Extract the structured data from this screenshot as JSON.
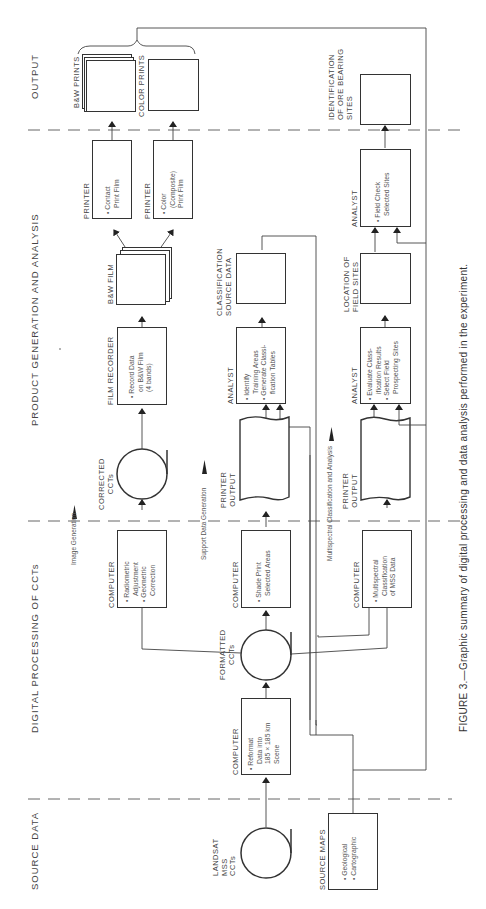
{
  "figure": {
    "caption": "FIGURE 3.—Graphic summary of digital processing and data analysis performed in the experiment."
  },
  "sections": {
    "output": "OUTPUT",
    "product": "PRODUCT GENERATION AND ANALYSIS",
    "digital": "DIGITAL PROCESSING OF CCTs",
    "source": "SOURCE DATA"
  },
  "flows": {
    "image_generation": "Image Generation",
    "support_data_generation": "Support Data Generation",
    "multispectral": "Multispectral Classification and Analysis"
  },
  "nodes": {
    "landsat": {
      "label": "LANDSAT",
      "line2": "MSS",
      "line3": "CCTs"
    },
    "source_maps": {
      "label": "SOURCE MAPS",
      "items": [
        "• Geological",
        "• Cartographic"
      ]
    },
    "reformat": {
      "label": "COMPUTER",
      "items": [
        "• Reformat",
        "Data into",
        "185 × 185 km",
        "Scene"
      ]
    },
    "formatted_ccts": {
      "label": "FORMATTED",
      "line2": "CCTs"
    },
    "radiometric": {
      "label": "COMPUTER",
      "items": [
        "• Radiometric",
        "Adjustment",
        "• Geometric",
        "Correction"
      ]
    },
    "shade_print": {
      "label": "COMPUTER",
      "items": [
        "• Shade Print",
        "Selected Areas"
      ]
    },
    "multispectral_class": {
      "label": "COMPUTER",
      "items": [
        "• Multispectral",
        "Classification",
        "of MSS Data"
      ]
    },
    "corrected_ccts": {
      "label": "CORRECTED",
      "line2": "CCTs"
    },
    "printer_output_1": {
      "label": "PRINTER",
      "line2": "OUTPUT"
    },
    "printer_output_2": {
      "label": "PRINTER",
      "line2": "OUTPUT"
    },
    "film_recorder": {
      "label": "FILM RECORDER",
      "items": [
        "• Record Data",
        "on B&W Film",
        "(4 bands)"
      ]
    },
    "analyst_1": {
      "label": "ANALYST",
      "items": [
        "• Identify",
        "Training Areas",
        "• Generate Classi-",
        "fication Tables"
      ]
    },
    "analyst_2": {
      "label": "ANALYST",
      "items": [
        "• Evaluate Class-",
        "ification Results",
        "• Select Field",
        "Prospecting Sites"
      ]
    },
    "bw_film": {
      "label": "B&W FILM"
    },
    "classification_source": {
      "label": "CLASSIFICATION",
      "line2": "SOURCE DATA"
    },
    "location_field_sites": {
      "label": "LOCATION OF",
      "line2": "FIELD SITES"
    },
    "printer_contact": {
      "label": "PRINTER",
      "items": [
        "• Contact",
        "Print Film"
      ]
    },
    "printer_color": {
      "label": "PRINTER",
      "items": [
        "• Color",
        "(Composite)",
        "Print Film"
      ]
    },
    "analyst_3": {
      "label": "ANALYST",
      "items": [
        "• Field Check",
        "Selected Sites"
      ]
    },
    "bw_prints": {
      "label": "B&W PRINTS"
    },
    "color_prints": {
      "label": "COLOR PRINTS"
    },
    "identification": {
      "label": "IDENTIFICATION",
      "line2": "OF ORE BEARING",
      "line3": "SITES"
    }
  }
}
